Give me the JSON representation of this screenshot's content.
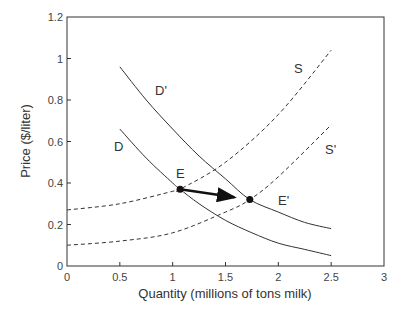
{
  "chart_data": {
    "type": "line",
    "title": "",
    "xlabel": "Quantity (millions of tons milk)",
    "ylabel": "Price ($/liter)",
    "xlim": [
      0,
      3
    ],
    "ylim": [
      0,
      1.2
    ],
    "xticks": [
      "0",
      "0.5",
      "1",
      "1.5",
      "2",
      "2.5",
      "3"
    ],
    "yticks": [
      "0",
      "0.2",
      "0.4",
      "0.6",
      "0.8",
      "1",
      "1.2"
    ],
    "grid": false,
    "legend": "none (curves labeled inline)",
    "series": [
      {
        "name": "D",
        "style": "solid",
        "x": [
          0.5,
          0.75,
          1.0,
          1.07,
          1.25,
          1.5,
          1.75,
          2.0,
          2.25,
          2.5
        ],
        "y": [
          0.66,
          0.52,
          0.4,
          0.37,
          0.3,
          0.22,
          0.16,
          0.11,
          0.08,
          0.05
        ]
      },
      {
        "name": "D'",
        "style": "solid",
        "x": [
          0.5,
          0.75,
          1.0,
          1.25,
          1.5,
          1.73,
          2.0,
          2.25,
          2.5
        ],
        "y": [
          0.96,
          0.8,
          0.66,
          0.53,
          0.42,
          0.32,
          0.26,
          0.21,
          0.18
        ]
      },
      {
        "name": "S",
        "style": "dashed",
        "x": [
          0,
          0.5,
          1.0,
          1.07,
          1.5,
          2.0,
          2.5
        ],
        "y": [
          0.27,
          0.3,
          0.36,
          0.37,
          0.5,
          0.73,
          1.04
        ]
      },
      {
        "name": "S'",
        "style": "dashed",
        "x": [
          0,
          0.5,
          1.0,
          1.5,
          1.73,
          2.0,
          2.5
        ],
        "y": [
          0.1,
          0.12,
          0.16,
          0.26,
          0.32,
          0.43,
          0.68
        ]
      }
    ],
    "points": [
      {
        "label": "E",
        "x": 1.07,
        "y": 0.37
      },
      {
        "label": "E'",
        "x": 1.73,
        "y": 0.32
      }
    ],
    "annotations": [
      {
        "type": "arrow",
        "from": "E",
        "to": "E'",
        "text": ""
      }
    ]
  },
  "labels": {
    "D": "D",
    "D_prime": "D'",
    "S": "S",
    "S_prime": "S'",
    "E": "E",
    "E_prime": "E'"
  }
}
